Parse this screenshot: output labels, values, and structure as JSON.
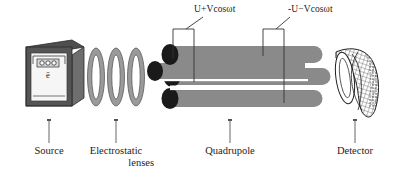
{
  "diagram": {
    "voltage_labels": [
      {
        "name": "positive-rod-voltage",
        "text": "U+Vcosωt"
      },
      {
        "name": "negative-rod-voltage",
        "text": "-U−Vcosωt"
      }
    ],
    "parts": [
      {
        "name": "source",
        "label_line1": "Source",
        "label_line2": ""
      },
      {
        "name": "electrostatic-lenses",
        "label_line1": "Electrostatic",
        "label_line2": "lenses"
      },
      {
        "name": "quadrupole",
        "label_line1": "Quadrupole",
        "label_line2": ""
      },
      {
        "name": "detector",
        "label_line1": "Detector",
        "label_line2": ""
      }
    ],
    "source_box": {
      "ionization_symbol": "ē",
      "filament_name": "filament-coil"
    },
    "lens_count": 3,
    "rod_count": 4,
    "colors": {
      "rod_fill": "#8a8a8a",
      "rod_end_dark": "#1a1a1a",
      "source_top": "#4f4f4f",
      "source_front": "#f2f2f2",
      "source_side": "#6e6e6e",
      "lens_fill": "#9a9a9a",
      "lens_hole": "#ffffff",
      "line_stroke": "#333333",
      "text": "#1c1c1c",
      "background": "#ffffff"
    }
  }
}
